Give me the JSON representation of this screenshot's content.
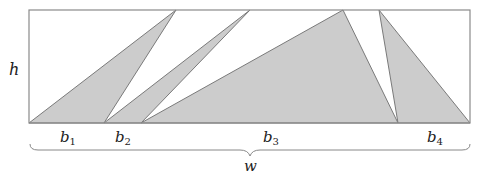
{
  "diagram": {
    "colors": {
      "fill": "#cccccc",
      "stroke": "#7a7a7a",
      "frame": "#8a8a8a",
      "text": "#222222"
    },
    "rect": {
      "x": 29,
      "y": 10,
      "w": 441,
      "h": 113
    },
    "triangles": [
      {
        "name": "triangle-b1",
        "points": "29,123 176,10 104,123"
      },
      {
        "name": "triangle-b2",
        "points": "104,123 250,10 141,123"
      },
      {
        "name": "triangle-b3",
        "points": "141,123 343,10 398,123"
      },
      {
        "name": "triangle-b4",
        "points": "398,123 379,10 470,123"
      }
    ],
    "labels": {
      "h": "h",
      "w": "w",
      "b1": {
        "base": "b",
        "sub": "1"
      },
      "b2": {
        "base": "b",
        "sub": "2"
      },
      "b3": {
        "base": "b",
        "sub": "3"
      },
      "b4": {
        "base": "b",
        "sub": "4"
      }
    }
  }
}
